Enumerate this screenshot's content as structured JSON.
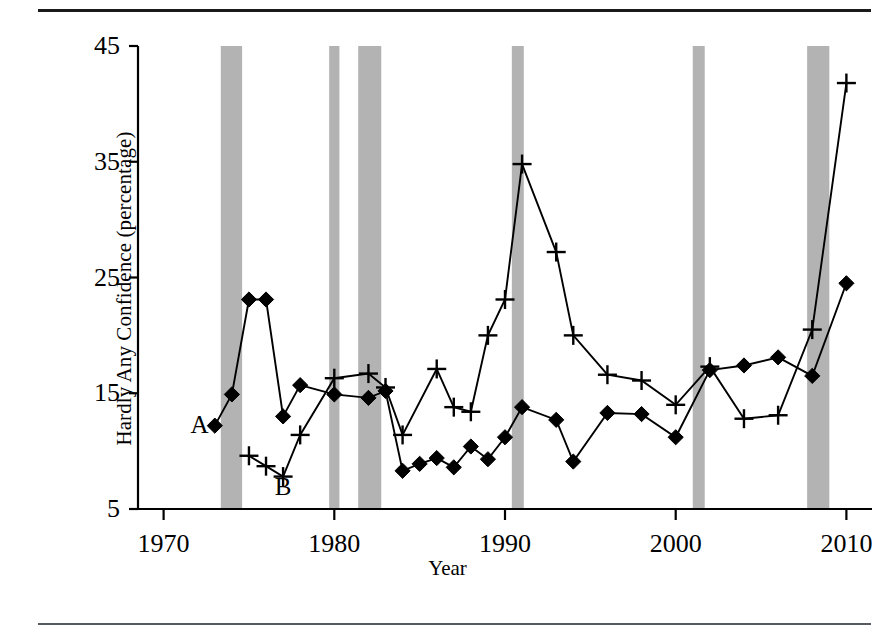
{
  "figure": {
    "top_rule": true,
    "bottom_rule": true
  },
  "chart_data": {
    "type": "line",
    "title": "",
    "xlabel": "Year",
    "ylabel": "Hardly Any Confidence (percentage)",
    "xlim": [
      1968.5,
      2011.5
    ],
    "ylim": [
      5,
      45
    ],
    "xticks": [
      1970,
      1980,
      1990,
      2000,
      2010
    ],
    "xticklabels": [
      "1970",
      "1980",
      "1990",
      "2000",
      "2010"
    ],
    "yticks": [
      5,
      15,
      25,
      35,
      45
    ],
    "yticklabels": [
      "5",
      "15",
      "25",
      "35",
      "45"
    ],
    "grid": false,
    "legend": "inline-annotations",
    "series": [
      {
        "name": "A",
        "marker": "diamond",
        "annotation": "A",
        "annotation_x": 1972.1,
        "annotation_y": 11.6,
        "x": [
          1973,
          1974,
          1975,
          1976,
          1977,
          1978,
          1980,
          1982,
          1983,
          1984,
          1985,
          1986,
          1987,
          1988,
          1989,
          1990,
          1991,
          1993,
          1994,
          1996,
          1998,
          2000,
          2002,
          2004,
          2006,
          2008,
          2010
        ],
        "y": [
          12.2,
          14.9,
          23.1,
          23.1,
          13.0,
          15.7,
          14.9,
          14.6,
          15.2,
          8.3,
          8.9,
          9.4,
          8.6,
          10.4,
          9.3,
          11.2,
          13.8,
          12.7,
          9.1,
          13.3,
          13.2,
          11.2,
          17.0,
          17.4,
          18.1,
          16.5,
          24.5
        ]
      },
      {
        "name": "B",
        "marker": "plus",
        "annotation": "B",
        "annotation_x": 1977.0,
        "annotation_y": 6.2,
        "x": [
          1975,
          1976,
          1977,
          1978,
          1980,
          1982,
          1983,
          1984,
          1986,
          1987,
          1988,
          1989,
          1990,
          1991,
          1993,
          1994,
          1996,
          1998,
          2000,
          2002,
          2004,
          2006,
          2008,
          2010
        ],
        "y": [
          9.6,
          8.7,
          7.8,
          11.4,
          16.3,
          16.7,
          15.5,
          11.4,
          17.1,
          13.8,
          13.4,
          20.0,
          23.1,
          34.8,
          27.2,
          20.0,
          16.6,
          16.1,
          14.0,
          17.3,
          12.8,
          13.1,
          20.5,
          41.8
        ]
      }
    ],
    "recession_bands": [
      {
        "start": 1973.35,
        "end": 1974.6
      },
      {
        "start": 1979.7,
        "end": 1980.3
      },
      {
        "start": 1981.4,
        "end": 1982.75
      },
      {
        "start": 1990.4,
        "end": 1991.1
      },
      {
        "start": 2001.0,
        "end": 2001.7
      },
      {
        "start": 2007.7,
        "end": 2009.0
      }
    ],
    "band_color": "#b3b3b3",
    "line_color": "#000000",
    "axis_color": "#000000"
  }
}
